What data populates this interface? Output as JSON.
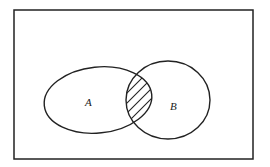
{
  "diagram": {
    "type": "venn",
    "sets": [
      {
        "label": "A",
        "shape": "ellipse"
      },
      {
        "label": "B",
        "shape": "circle"
      }
    ],
    "shaded_region": "A ∩ B",
    "colors": {
      "stroke": "#222222",
      "background": "#ffffff"
    }
  }
}
